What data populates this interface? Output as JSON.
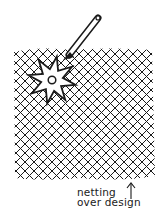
{
  "illustration": {
    "subject": "star stencil under netting with applicator tool",
    "stroke_color": "#1a1a1a",
    "background": "#ffffff",
    "netting": {
      "x": 12,
      "y": 48,
      "width": 143,
      "height": 133,
      "spacing": 9
    },
    "star": {
      "cx": 52,
      "cy": 80,
      "points": 8,
      "outer_r": 24,
      "inner_r": 11
    },
    "tool": {
      "from": [
        98,
        18
      ],
      "to": [
        68,
        58
      ]
    },
    "indicator_arrow": {
      "x": 131,
      "y_from": 200,
      "y_to": 184
    }
  },
  "caption": {
    "line1": "netting",
    "line2": "over design"
  }
}
